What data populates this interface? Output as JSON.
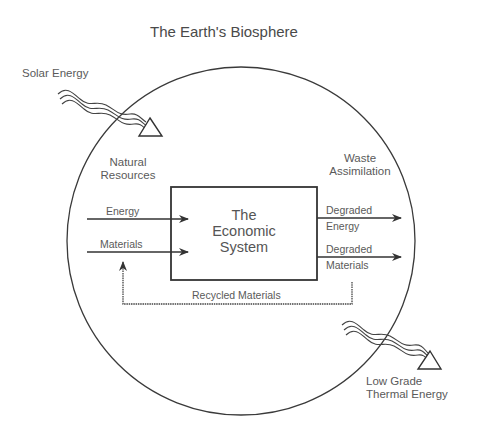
{
  "title": "The Earth's Biosphere",
  "inputs": {
    "solar_energy": "Solar Energy",
    "natural_resources_line1": "Natural",
    "natural_resources_line2": "Resources",
    "energy": "Energy",
    "materials": "Materials"
  },
  "system": {
    "line1": "The",
    "line2": "Economic",
    "line3": "System"
  },
  "outputs": {
    "waste_line1": "Waste",
    "waste_line2": "Assimilation",
    "degraded_energy_line1": "Degraded",
    "degraded_energy_line2": "Energy",
    "degraded_materials_line1": "Degraded",
    "degraded_materials_line2": "Materials",
    "thermal_line1": "Low Grade",
    "thermal_line2": "Thermal Energy"
  },
  "feedback": {
    "recycled": "Recycled Materials"
  },
  "colors": {
    "line": "#333333",
    "text": "#5a5a5a"
  }
}
